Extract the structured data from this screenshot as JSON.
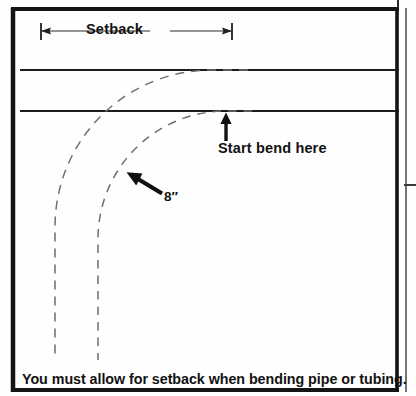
{
  "figure": {
    "title_caption": "You must allow for setback when bending pipe or tubing.",
    "dimension_label": "Setback",
    "annotations": [
      {
        "name": "start-bend",
        "text": "Start bend here"
      },
      {
        "name": "radius",
        "text": "8″"
      }
    ],
    "colors": {
      "ink": "#121212",
      "frame": "#111111",
      "solid_line": "#1c1c1c",
      "dashed_line": "#6f6f6f",
      "background": "#fefefe"
    },
    "geometry": {
      "frame": {
        "x": 11,
        "y": 8,
        "width": 388,
        "height": 384,
        "border_px": 4
      },
      "right_panel": {
        "x": 404,
        "y": 8,
        "divider_y": 185
      },
      "dimension_line": {
        "y": 31,
        "x_start": 41,
        "x_end": 232,
        "tick_half_height": 8
      },
      "upper_pipe_line": {
        "y": 70,
        "x_start": 20,
        "x_end": 399
      },
      "lower_pipe_line": {
        "y": 111,
        "x_start": 20,
        "x_end": 399
      },
      "outer_arc": {
        "tangent_x": 212,
        "tangent_y": 70,
        "vertical_x": 55,
        "end_y": 360
      },
      "inner_arc": {
        "tangent_x": 226,
        "tangent_y": 111,
        "vertical_x": 98,
        "end_y": 360
      },
      "vertical_arrow": {
        "x": 226,
        "y_tip": 114,
        "y_tail": 141
      },
      "diagonal_arrow": {
        "x_tail": 163,
        "y_tail": 194,
        "x_tip": 126,
        "y_tip": 172
      }
    }
  }
}
